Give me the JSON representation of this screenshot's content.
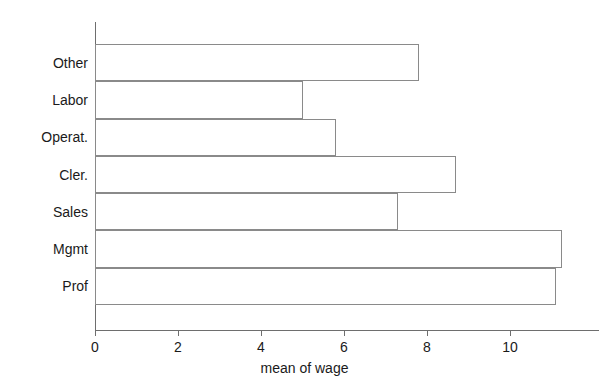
{
  "chart_data": {
    "type": "bar",
    "orientation": "horizontal",
    "title": "",
    "subtitle": "",
    "xlabel": "mean of wage",
    "ylabel": "",
    "categories": [
      "Other",
      "Labor",
      "Operat.",
      "Cler.",
      "Sales",
      "Mgmt",
      "Prof"
    ],
    "values": [
      7.8,
      5.0,
      5.8,
      8.7,
      7.3,
      11.25,
      11.1
    ],
    "series": [
      {
        "name": "mean of wage",
        "values": [
          7.8,
          5.0,
          5.8,
          8.7,
          7.3,
          11.25,
          11.1
        ]
      }
    ],
    "xlim": [
      0,
      12.15
    ],
    "xticks": [
      0,
      2,
      4,
      6,
      8,
      10
    ],
    "xtick_labels": [
      "0",
      "2",
      "4",
      "6",
      "8",
      "10"
    ],
    "grid": false,
    "legend": null,
    "bar_fill_color": "#ffffff",
    "bar_border_color": "#8a8a8a",
    "axis_color": "#6e6e6e",
    "text_color": "#1a1a1a",
    "background_color": "#ffffff"
  }
}
